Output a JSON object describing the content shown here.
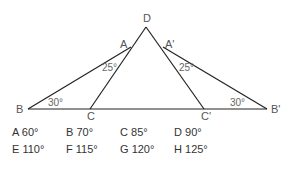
{
  "figure": {
    "points": {
      "D": {
        "label": "D",
        "x": 146,
        "y": 27
      },
      "A": {
        "label": "A",
        "x": 131,
        "y": 47
      },
      "A_prime": {
        "label": "A'",
        "x": 163,
        "y": 47
      },
      "B": {
        "label": "B",
        "x": 28,
        "y": 109
      },
      "C": {
        "label": "C",
        "x": 90,
        "y": 109
      },
      "C_prime": {
        "label": "C'",
        "x": 204,
        "y": 109
      },
      "B_prime": {
        "label": "B'",
        "x": 267,
        "y": 109
      }
    },
    "angles": {
      "left_A": "25°",
      "right_A": "25°",
      "left_B": "30°",
      "right_B": "30°"
    },
    "line_color": "#222222"
  },
  "options": [
    {
      "letter": "A",
      "value": "60°"
    },
    {
      "letter": "B",
      "value": "70°"
    },
    {
      "letter": "C",
      "value": "85°"
    },
    {
      "letter": "D",
      "value": "90°"
    },
    {
      "letter": "E",
      "value": "110°"
    },
    {
      "letter": "F",
      "value": "115°"
    },
    {
      "letter": "G",
      "value": "120°"
    },
    {
      "letter": "H",
      "value": "125°"
    }
  ]
}
